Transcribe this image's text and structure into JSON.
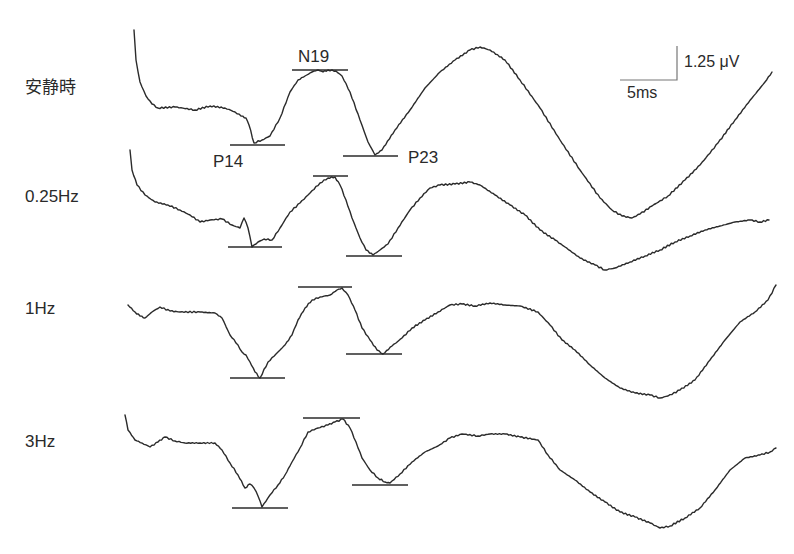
{
  "figure": {
    "rows": [
      {
        "label": "安静時"
      },
      {
        "label": "0.25Hz"
      },
      {
        "label": "1Hz"
      },
      {
        "label": "3Hz"
      }
    ],
    "peaks": {
      "n19": "N19",
      "p14": "P14",
      "p23": "P23"
    },
    "scale_bar": {
      "amplitude": "1.25 μV",
      "time": "5ms"
    }
  },
  "chart_data": {
    "type": "line",
    "title": "",
    "xlabel": "",
    "ylabel": "",
    "grid": false,
    "legend": "row labels at left of each trace",
    "scale_bar": {
      "amplitude_uV": 1.25,
      "time_ms": 5
    },
    "peak_labels": [
      "P14",
      "N19",
      "P23"
    ],
    "series": [
      {
        "name": "安静時",
        "points": [
          [
            134,
            30
          ],
          [
            136,
            60
          ],
          [
            140,
            82
          ],
          [
            146,
            96
          ],
          [
            152,
            104
          ],
          [
            158,
            108
          ],
          [
            175,
            107
          ],
          [
            195,
            110
          ],
          [
            210,
            106
          ],
          [
            225,
            108
          ],
          [
            235,
            112
          ],
          [
            241,
            116
          ],
          [
            246,
            118
          ],
          [
            249,
            125
          ],
          [
            254,
            143
          ],
          [
            262,
            140
          ],
          [
            270,
            136
          ],
          [
            280,
            118
          ],
          [
            290,
            92
          ],
          [
            298,
            80
          ],
          [
            305,
            76
          ],
          [
            312,
            72
          ],
          [
            318,
            70
          ],
          [
            323,
            72
          ],
          [
            328,
            70
          ],
          [
            336,
            71
          ],
          [
            342,
            76
          ],
          [
            350,
            92
          ],
          [
            360,
            120
          ],
          [
            368,
            142
          ],
          [
            375,
            155
          ],
          [
            382,
            150
          ],
          [
            395,
            130
          ],
          [
            410,
            110
          ],
          [
            425,
            88
          ],
          [
            440,
            72
          ],
          [
            455,
            60
          ],
          [
            470,
            50
          ],
          [
            480,
            47
          ],
          [
            490,
            50
          ],
          [
            505,
            60
          ],
          [
            520,
            80
          ],
          [
            540,
            108
          ],
          [
            560,
            140
          ],
          [
            580,
            170
          ],
          [
            600,
            198
          ],
          [
            612,
            210
          ],
          [
            622,
            216
          ],
          [
            632,
            218
          ],
          [
            640,
            214
          ],
          [
            652,
            206
          ],
          [
            668,
            196
          ],
          [
            685,
            180
          ],
          [
            700,
            165
          ],
          [
            718,
            143
          ],
          [
            735,
            120
          ],
          [
            752,
            98
          ],
          [
            765,
            82
          ],
          [
            772,
            72
          ]
        ],
        "markers": {
          "P14": {
            "y": 145,
            "x": [
              230,
              285
            ]
          },
          "N19": {
            "y": 70,
            "x": [
              292,
              348
            ]
          },
          "P23": {
            "y": 156,
            "x": [
              343,
              398
            ]
          }
        }
      },
      {
        "name": "0.25Hz",
        "points": [
          [
            130,
            150
          ],
          [
            132,
            170
          ],
          [
            137,
            185
          ],
          [
            145,
            195
          ],
          [
            155,
            202
          ],
          [
            168,
            205
          ],
          [
            180,
            210
          ],
          [
            190,
            215
          ],
          [
            200,
            222
          ],
          [
            210,
            220
          ],
          [
            222,
            219
          ],
          [
            232,
            225
          ],
          [
            240,
            228
          ],
          [
            244,
            218
          ],
          [
            248,
            228
          ],
          [
            252,
            247
          ],
          [
            258,
            242
          ],
          [
            264,
            239
          ],
          [
            272,
            240
          ],
          [
            280,
            228
          ],
          [
            290,
            212
          ],
          [
            300,
            203
          ],
          [
            310,
            193
          ],
          [
            320,
            183
          ],
          [
            328,
            178
          ],
          [
            335,
            177
          ],
          [
            340,
            185
          ],
          [
            346,
            200
          ],
          [
            352,
            218
          ],
          [
            360,
            238
          ],
          [
            366,
            250
          ],
          [
            373,
            255
          ],
          [
            380,
            250
          ],
          [
            388,
            244
          ],
          [
            398,
            228
          ],
          [
            410,
            210
          ],
          [
            420,
            198
          ],
          [
            430,
            188
          ],
          [
            440,
            185
          ],
          [
            455,
            184
          ],
          [
            470,
            182
          ],
          [
            480,
            185
          ],
          [
            495,
            195
          ],
          [
            510,
            205
          ],
          [
            525,
            215
          ],
          [
            540,
            230
          ],
          [
            555,
            240
          ],
          [
            565,
            247
          ],
          [
            580,
            258
          ],
          [
            595,
            265
          ],
          [
            605,
            270
          ],
          [
            615,
            268
          ],
          [
            630,
            262
          ],
          [
            645,
            256
          ],
          [
            660,
            250
          ],
          [
            675,
            242
          ],
          [
            690,
            236
          ],
          [
            705,
            230
          ],
          [
            720,
            226
          ],
          [
            735,
            222
          ],
          [
            750,
            220
          ],
          [
            760,
            222
          ],
          [
            769,
            220
          ]
        ],
        "markers": {
          "P14": {
            "y": 247,
            "x": [
              228,
              282
            ]
          },
          "N19": {
            "y": 176,
            "x": [
              313,
              348
            ]
          },
          "P23": {
            "y": 256,
            "x": [
              346,
              402
            ]
          }
        }
      },
      {
        "name": "1Hz",
        "points": [
          [
            128,
            305
          ],
          [
            135,
            312
          ],
          [
            140,
            316
          ],
          [
            145,
            318
          ],
          [
            152,
            312
          ],
          [
            160,
            307
          ],
          [
            170,
            311
          ],
          [
            180,
            312
          ],
          [
            200,
            312
          ],
          [
            215,
            313
          ],
          [
            222,
            318
          ],
          [
            230,
            335
          ],
          [
            238,
            345
          ],
          [
            242,
            352
          ],
          [
            246,
            355
          ],
          [
            250,
            362
          ],
          [
            255,
            372
          ],
          [
            260,
            378
          ],
          [
            268,
            362
          ],
          [
            278,
            352
          ],
          [
            285,
            345
          ],
          [
            292,
            335
          ],
          [
            298,
            320
          ],
          [
            305,
            308
          ],
          [
            312,
            300
          ],
          [
            320,
            297
          ],
          [
            330,
            295
          ],
          [
            337,
            290
          ],
          [
            342,
            288
          ],
          [
            348,
            295
          ],
          [
            355,
            310
          ],
          [
            362,
            328
          ],
          [
            370,
            340
          ],
          [
            377,
            350
          ],
          [
            383,
            354
          ],
          [
            392,
            346
          ],
          [
            402,
            338
          ],
          [
            412,
            328
          ],
          [
            425,
            320
          ],
          [
            438,
            312
          ],
          [
            450,
            305
          ],
          [
            462,
            304
          ],
          [
            475,
            306
          ],
          [
            490,
            303
          ],
          [
            505,
            305
          ],
          [
            520,
            306
          ],
          [
            538,
            312
          ],
          [
            550,
            325
          ],
          [
            562,
            340
          ],
          [
            575,
            350
          ],
          [
            590,
            365
          ],
          [
            605,
            378
          ],
          [
            620,
            388
          ],
          [
            635,
            393
          ],
          [
            650,
            395
          ],
          [
            660,
            398
          ],
          [
            668,
            396
          ],
          [
            680,
            390
          ],
          [
            695,
            380
          ],
          [
            710,
            360
          ],
          [
            725,
            340
          ],
          [
            740,
            322
          ],
          [
            755,
            312
          ],
          [
            768,
            300
          ],
          [
            776,
            285
          ]
        ],
        "markers": {
          "P14": {
            "y": 378,
            "x": [
              230,
              285
            ]
          },
          "N19": {
            "y": 287,
            "x": [
              298,
              352
            ]
          },
          "P23": {
            "y": 354,
            "x": [
              346,
              402
            ]
          }
        }
      },
      {
        "name": "3Hz",
        "points": [
          [
            125,
            415
          ],
          [
            128,
            430
          ],
          [
            135,
            440
          ],
          [
            142,
            443
          ],
          [
            150,
            447
          ],
          [
            158,
            442
          ],
          [
            165,
            437
          ],
          [
            175,
            441
          ],
          [
            185,
            443
          ],
          [
            200,
            443
          ],
          [
            215,
            443
          ],
          [
            222,
            450
          ],
          [
            230,
            463
          ],
          [
            238,
            475
          ],
          [
            245,
            488
          ],
          [
            250,
            484
          ],
          [
            254,
            488
          ],
          [
            258,
            496
          ],
          [
            262,
            507
          ],
          [
            270,
            495
          ],
          [
            278,
            485
          ],
          [
            285,
            475
          ],
          [
            292,
            462
          ],
          [
            300,
            448
          ],
          [
            308,
            432
          ],
          [
            318,
            428
          ],
          [
            328,
            425
          ],
          [
            335,
            422
          ],
          [
            343,
            419
          ],
          [
            350,
            428
          ],
          [
            356,
            442
          ],
          [
            362,
            458
          ],
          [
            370,
            470
          ],
          [
            378,
            478
          ],
          [
            385,
            482
          ],
          [
            390,
            483
          ],
          [
            400,
            474
          ],
          [
            412,
            462
          ],
          [
            425,
            452
          ],
          [
            438,
            446
          ],
          [
            450,
            438
          ],
          [
            462,
            434
          ],
          [
            478,
            436
          ],
          [
            490,
            434
          ],
          [
            505,
            434
          ],
          [
            520,
            437
          ],
          [
            538,
            440
          ],
          [
            548,
            455
          ],
          [
            560,
            470
          ],
          [
            575,
            480
          ],
          [
            590,
            492
          ],
          [
            605,
            502
          ],
          [
            620,
            512
          ],
          [
            635,
            517
          ],
          [
            650,
            523
          ],
          [
            660,
            528
          ],
          [
            670,
            526
          ],
          [
            685,
            518
          ],
          [
            700,
            508
          ],
          [
            715,
            490
          ],
          [
            730,
            470
          ],
          [
            745,
            458
          ],
          [
            760,
            455
          ],
          [
            770,
            452
          ],
          [
            776,
            448
          ]
        ],
        "markers": {
          "P14": {
            "y": 508,
            "x": [
              232,
              288
            ]
          },
          "N19": {
            "y": 418,
            "x": [
              303,
              360
            ]
          },
          "P23": {
            "y": 485,
            "x": [
              352,
              408
            ]
          }
        }
      }
    ]
  }
}
